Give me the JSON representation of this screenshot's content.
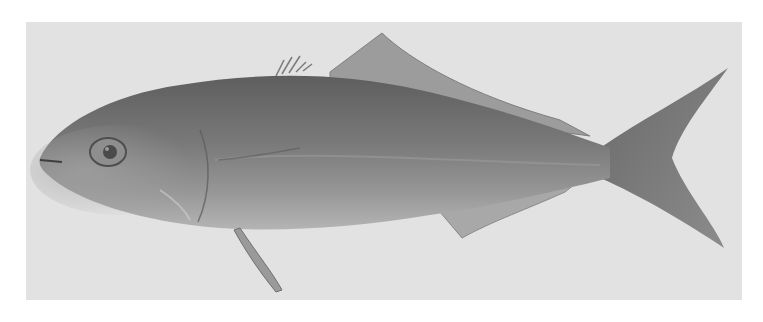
{
  "image": {
    "subject": "fish illustration",
    "description": "Grayscale illustration of a fish (amberjack / yellowtail type) swimming left, on a light gray textured plate",
    "colors": {
      "page_background": "#ffffff",
      "plate_background": "#e2e2e2",
      "body_dark": "#6f6f6f",
      "body_mid": "#8a8a8a",
      "belly_light": "#b8b8b8",
      "fin": "#9a9a9a",
      "eye": "#4a4a4a"
    }
  }
}
